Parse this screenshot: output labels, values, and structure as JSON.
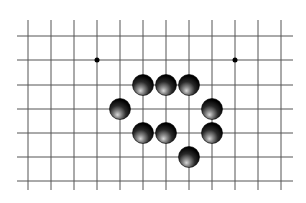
{
  "diagram": {
    "type": "go-board-fragment",
    "background": "#ffffff",
    "line_color": "#555555",
    "grid": {
      "columns_x": [
        28,
        51,
        74,
        97,
        120,
        143,
        166,
        189,
        212,
        235,
        258,
        281
      ],
      "rows_y": [
        36,
        60,
        85,
        109,
        133,
        157,
        181
      ],
      "h_line_x_start": 17,
      "h_line_x_end": 293,
      "v_line_y_start": 20,
      "v_line_y_end": 190
    },
    "star_points": [
      {
        "col": 3,
        "row": 1
      },
      {
        "col": 9,
        "row": 1
      }
    ],
    "stones": [
      {
        "color": "black",
        "col": 5,
        "row": 2
      },
      {
        "color": "black",
        "col": 6,
        "row": 2
      },
      {
        "color": "black",
        "col": 7,
        "row": 2
      },
      {
        "color": "black",
        "col": 4,
        "row": 3
      },
      {
        "color": "black",
        "col": 8,
        "row": 3
      },
      {
        "color": "black",
        "col": 5,
        "row": 4
      },
      {
        "color": "black",
        "col": 6,
        "row": 4
      },
      {
        "color": "black",
        "col": 8,
        "row": 4
      },
      {
        "color": "black",
        "col": 7,
        "row": 5
      }
    ],
    "stone_radius": 10.5,
    "star_radius": 2.5
  }
}
